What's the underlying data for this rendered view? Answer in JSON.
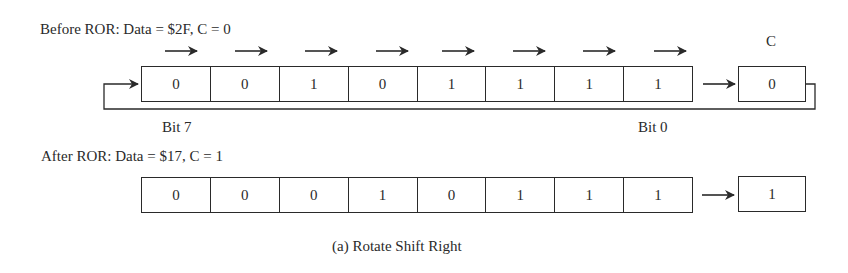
{
  "figure": {
    "caption": "(a) Rotate Shift Right",
    "before": {
      "title": "Before ROR: Data = $2F, C = 0",
      "bits": [
        "0",
        "0",
        "1",
        "0",
        "1",
        "1",
        "1",
        "1"
      ],
      "carry_label": "C",
      "carry_value": "0",
      "msb_label": "Bit 7",
      "lsb_label": "Bit 0",
      "shift_arrows": 8
    },
    "after": {
      "title": "After ROR: Data = $17, C = 1",
      "bits": [
        "0",
        "0",
        "0",
        "1",
        "0",
        "1",
        "1",
        "1"
      ],
      "carry_value": "1"
    }
  },
  "icons": {
    "shift_arrow": "right-arrow-icon",
    "carry_arrow": "right-arrow-icon",
    "feedback_loop": "rotate-loop-line"
  },
  "colors": {
    "ink": "#2a2a2a",
    "background": "#ffffff"
  }
}
